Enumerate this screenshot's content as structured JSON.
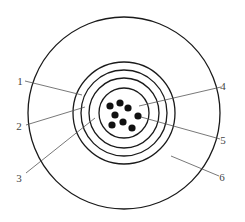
{
  "diagram": {
    "type": "cross-section",
    "center": [
      124,
      113
    ],
    "outer_circle_radius": 96,
    "concentric_rings_radii": [
      51,
      43,
      35,
      25
    ],
    "dots": [
      [
        110,
        106
      ],
      [
        120,
        103
      ],
      [
        128,
        108
      ],
      [
        115,
        115
      ],
      [
        138,
        116
      ],
      [
        112,
        125
      ],
      [
        123,
        122
      ],
      [
        132,
        128
      ]
    ],
    "dot_radius": 3.6,
    "labels": [
      {
        "text": "1",
        "x": 20,
        "y": 85,
        "line": [
          25,
          81,
          82,
          95
        ]
      },
      {
        "text": "2",
        "x": 19,
        "y": 130,
        "line": [
          26,
          125,
          85,
          107
        ]
      },
      {
        "text": "3",
        "x": 19,
        "y": 182,
        "line": [
          26,
          173,
          95,
          118
        ]
      },
      {
        "text": "4",
        "x": 223,
        "y": 90,
        "line": [
          221,
          87,
          139,
          106
        ]
      },
      {
        "text": "5",
        "x": 223,
        "y": 144,
        "line": [
          220,
          139,
          141,
          117
        ]
      },
      {
        "text": "6",
        "x": 222,
        "y": 181,
        "line": [
          219,
          176,
          171,
          156
        ]
      }
    ]
  }
}
